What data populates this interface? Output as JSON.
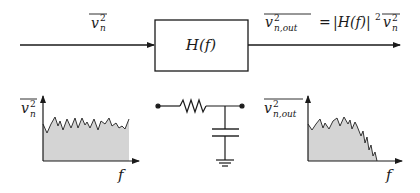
{
  "diagram": {
    "input_signal": {
      "symbol": "v",
      "subscript": "n",
      "superscript": "2",
      "overline": true
    },
    "filter_block": {
      "label": "H(f)"
    },
    "output_signal": {
      "lhs_symbol": "v",
      "lhs_subscript": "n,out",
      "lhs_superscript": "2",
      "equals": "=",
      "rhs_abs_open": "|H(f)|",
      "rhs_power": "2",
      "rhs_symbol": "v",
      "rhs_subscript": "n",
      "rhs_superscript": "2"
    },
    "input_spectrum": {
      "y_label_symbol": "v",
      "y_label_subscript": "n",
      "y_label_superscript": "2",
      "x_label": "f",
      "shape": "flat white noise"
    },
    "circuit": {
      "type": "RC low-pass filter",
      "components": [
        "resistor",
        "capacitor",
        "ground"
      ]
    },
    "output_spectrum": {
      "y_label_symbol": "v",
      "y_label_subscript": "n,out",
      "y_label_superscript": "2",
      "x_label": "f",
      "shape": "low-pass filtered noise"
    },
    "colors": {
      "stroke": "#1a1a1a",
      "fill_area": "#d4d4d4",
      "noise_line": "#333333"
    }
  }
}
